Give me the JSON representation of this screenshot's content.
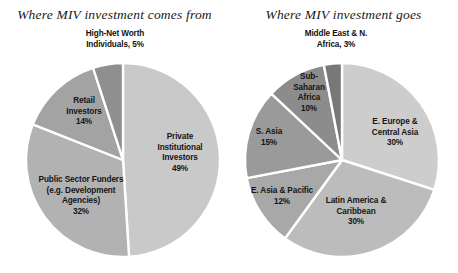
{
  "figure": {
    "width": 458,
    "height": 273,
    "background": "#ffffff"
  },
  "charts": [
    {
      "id": "miv-sources",
      "title": "Where MIV investment comes from",
      "center": {
        "x": 123,
        "y": 160
      },
      "radius": 97,
      "start_angle_deg": 0,
      "direction": "clockwise",
      "slices": [
        {
          "label": "Private\nInstitutional\nInvestors\n49%",
          "name": "Private Institutional Investors",
          "value": 49,
          "color": "#c9c9c9",
          "label_pos": {
            "x": 150,
            "y": 132
          },
          "label_width": 60,
          "outside": false
        },
        {
          "label": "Public Sector Funders\n(e.g. Development\nAgencies)\n32%",
          "name": "Public Sector Funders (e.g. Development Agencies)",
          "value": 32,
          "color": "#b2b2b2",
          "label_pos": {
            "x": 32,
            "y": 175
          },
          "label_width": 98,
          "outside": false
        },
        {
          "label": "Retail\nInvestors\n14%",
          "name": "Retail Investors",
          "value": 14,
          "color": "#a3a3a3",
          "label_pos": {
            "x": 55,
            "y": 96
          },
          "label_width": 58,
          "outside": false
        },
        {
          "label": "High-Net Worth\nIndividuals, 5%",
          "name": "High-Net Worth Individuals",
          "value": 5,
          "color": "#8f8f8f",
          "label_pos": {
            "x": 61,
            "y": 29
          },
          "label_width": 108,
          "outside": true
        }
      ]
    },
    {
      "id": "miv-destinations",
      "title": "Where MIV investment goes",
      "center": {
        "x": 113,
        "y": 160
      },
      "radius": 97,
      "start_angle_deg": 0,
      "direction": "clockwise",
      "slices": [
        {
          "label": "E. Europe &\nCentral Asia\n30%",
          "name": "E. Europe & Central Asia",
          "value": 30,
          "color": "#cdcdcd",
          "label_pos": {
            "x": 130,
            "y": 117
          },
          "label_width": 72,
          "outside": false
        },
        {
          "label": "Latin America &\nCaribbean\n30%",
          "name": "Latin America & Caribbean",
          "value": 30,
          "color": "#bcbcbc",
          "label_pos": {
            "x": 85,
            "y": 196
          },
          "label_width": 84,
          "outside": false
        },
        {
          "label": "E. Asia & Pacific\n12%",
          "name": "E. Asia & Pacific",
          "value": 12,
          "color": "#a8a8a8",
          "label_pos": {
            "x": 12,
            "y": 186
          },
          "label_width": 82,
          "outside": false
        },
        {
          "label": "S. Asia\n15%",
          "name": "S. Asia",
          "value": 15,
          "color": "#9a9a9a",
          "label_pos": {
            "x": 16,
            "y": 127
          },
          "label_width": 48,
          "outside": false
        },
        {
          "label": "Sub-\nSaharan\nAfrica\n10%",
          "name": "Sub-Saharan Africa",
          "value": 10,
          "color": "#8c8c8c",
          "label_pos": {
            "x": 57,
            "y": 72
          },
          "label_width": 46,
          "outside": false
        },
        {
          "label": "Middle East & N.\nAfrica, 3%",
          "name": "Middle East & N. Africa",
          "value": 3,
          "color": "#787878",
          "label_pos": {
            "x": 48,
            "y": 29
          },
          "label_width": 118,
          "outside": true
        }
      ]
    }
  ],
  "chart_data": {
    "type": "pie",
    "charts": [
      {
        "title": "Where MIV investment comes from",
        "categories": [
          "Private Institutional Investors",
          "Public Sector Funders (e.g. Development Agencies)",
          "Retail Investors",
          "High-Net Worth Individuals"
        ],
        "values": [
          49,
          32,
          14,
          5
        ],
        "unit": "percent",
        "total": 100,
        "legend": "none (direct slice labels)",
        "colors": [
          "#c9c9c9",
          "#b2b2b2",
          "#a3a3a3",
          "#8f8f8f"
        ]
      },
      {
        "title": "Where MIV investment goes",
        "categories": [
          "E. Europe & Central Asia",
          "Latin America & Caribbean",
          "E. Asia & Pacific",
          "S. Asia",
          "Sub-Saharan Africa",
          "Middle East & N. Africa"
        ],
        "values": [
          30,
          30,
          12,
          15,
          10,
          3
        ],
        "unit": "percent",
        "total": 100,
        "legend": "none (direct slice labels)",
        "colors": [
          "#cdcdcd",
          "#bcbcbc",
          "#a8a8a8",
          "#9a9a9a",
          "#8c8c8c",
          "#787878"
        ]
      }
    ]
  }
}
